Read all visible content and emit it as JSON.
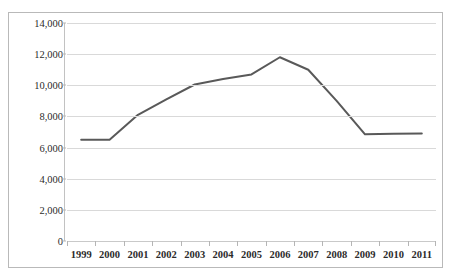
{
  "page": {
    "cropped_text_above_chart": ""
  },
  "chart_data": {
    "type": "line",
    "title": "",
    "xlabel": "",
    "ylabel": "",
    "categories": [
      "1999",
      "2000",
      "2001",
      "2002",
      "2003",
      "2004",
      "2005",
      "2006",
      "2007",
      "2008",
      "2009",
      "2010",
      "2011"
    ],
    "values": [
      6500,
      6500,
      8100,
      9100,
      10050,
      10400,
      10700,
      11800,
      11000,
      9000,
      6850,
      6880,
      6900
    ],
    "series": [
      {
        "name": "",
        "values": [
          6500,
          6500,
          8100,
          9100,
          10050,
          10400,
          10700,
          11800,
          11000,
          9000,
          6850,
          6880,
          6900
        ]
      }
    ],
    "ylim": [
      0,
      14000
    ],
    "ytick_values": [
      0,
      2000,
      4000,
      6000,
      8000,
      10000,
      12000,
      14000
    ],
    "ytick_labels": [
      "0",
      "2,000",
      "4,000",
      "6,000",
      "8,000",
      "10,000",
      "12,000",
      "14,000"
    ],
    "grid": true,
    "grid_axis": "y",
    "legend": false,
    "legend_position": "none",
    "line_color": "#595959",
    "line_width": 2,
    "markers": false,
    "background_color": "#ffffff",
    "gridline_color": "#d9d9d9",
    "border_color": "#b9b9b9",
    "text_color": "#2b2b2b"
  }
}
